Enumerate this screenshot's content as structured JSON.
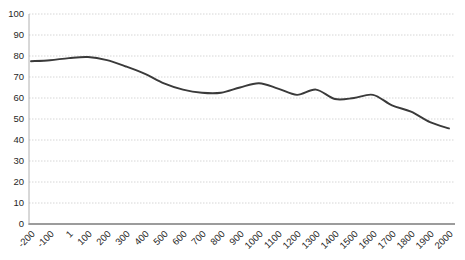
{
  "page": {
    "background": "#ffffff"
  },
  "style": {
    "line_color": "#3a3a3a",
    "grid_color": "#d6d6d6",
    "y_axis_color": "#b0b0b0",
    "x_axis_color": "#9c9c9c",
    "label_color": "#1f1f1f"
  },
  "chart_data": {
    "type": "line",
    "title": "",
    "xlabel": "",
    "ylabel": "",
    "categories": [
      "-200",
      "-100",
      "1",
      "100",
      "200",
      "300",
      "400",
      "500",
      "600",
      "700",
      "800",
      "900",
      "1000",
      "1100",
      "1200",
      "1300",
      "1400",
      "1500",
      "1600",
      "1700",
      "1800",
      "1900",
      "2000"
    ],
    "values": [
      77.5,
      78,
      79,
      79.5,
      78,
      75,
      71.5,
      67,
      64,
      62.5,
      62.5,
      65,
      67,
      64.5,
      61.5,
      64,
      59.5,
      60,
      61.5,
      56.5,
      53.5,
      48.5,
      45.5
    ],
    "ylim": [
      0,
      100
    ],
    "y_ticks": [
      0,
      10,
      20,
      30,
      40,
      50,
      60,
      70,
      80,
      90,
      100
    ],
    "grid": "horizontal-only",
    "gridline_style": "dotted",
    "legend": "none",
    "smooth": true,
    "x_label_rotation": -45
  }
}
